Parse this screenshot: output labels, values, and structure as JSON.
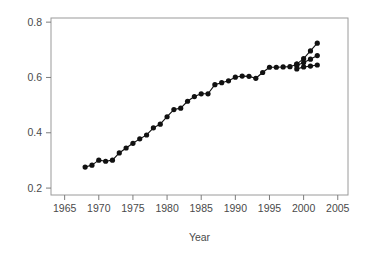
{
  "chart_data": {
    "type": "line",
    "title": "",
    "xlabel": "Year",
    "ylabel": "",
    "xlim": [
      1963,
      2006.5
    ],
    "ylim": [
      0.175,
      0.815
    ],
    "xticks": [
      1965,
      1970,
      1975,
      1980,
      1985,
      1990,
      1995,
      2000,
      2005
    ],
    "xtick_labels": [
      "1965",
      "1970",
      "1975",
      "1980",
      "1985",
      "1990",
      "1995",
      "2000",
      "2005"
    ],
    "yticks": [
      0.2,
      0.4,
      0.6,
      0.8
    ],
    "ytick_labels": [
      "0.2",
      "0.4",
      "0.6",
      "0.8"
    ],
    "grid": false,
    "legend": "none",
    "marker": "filled-circle",
    "marker_size": 2.6,
    "line_color": "#111111",
    "frame_color": "#9a9a9a",
    "series": [
      {
        "name": "main",
        "x": [
          1968,
          1969,
          1970,
          1971,
          1972,
          1973,
          1974,
          1975,
          1976,
          1977,
          1978,
          1979,
          1980,
          1981,
          1982,
          1983,
          1984,
          1985,
          1986,
          1987,
          1988,
          1989,
          1990,
          1991,
          1992,
          1993,
          1994,
          1995,
          1996,
          1997,
          1998,
          1999
        ],
        "values": [
          0.276,
          0.283,
          0.301,
          0.297,
          0.301,
          0.327,
          0.345,
          0.362,
          0.378,
          0.392,
          0.418,
          0.431,
          0.458,
          0.484,
          0.489,
          0.514,
          0.531,
          0.541,
          0.541,
          0.574,
          0.581,
          0.588,
          0.601,
          0.605,
          0.604,
          0.597,
          0.618,
          0.637,
          0.637,
          0.638,
          0.639,
          0.648
        ]
      },
      {
        "name": "branch-upper",
        "x": [
          1999,
          2000,
          2001,
          2002
        ],
        "values": [
          0.648,
          0.668,
          0.696,
          0.724
        ]
      },
      {
        "name": "branch-middle",
        "x": [
          1999,
          2000,
          2001,
          2002
        ],
        "values": [
          0.643,
          0.654,
          0.666,
          0.679
        ]
      },
      {
        "name": "branch-lower",
        "x": [
          1999,
          2000,
          2001,
          2002
        ],
        "values": [
          0.631,
          0.638,
          0.641,
          0.645
        ]
      }
    ]
  }
}
